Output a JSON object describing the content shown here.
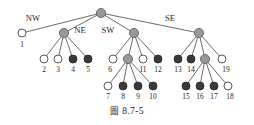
{
  "figure": {
    "caption_prefix": "圖",
    "caption_number": "8.7-5",
    "caption_full": "圖 8.7-5"
  },
  "colors": {
    "white_node": "#ffffff",
    "gray_node": "#989898",
    "dark_node": "#3a3a3a",
    "edge": "#2b2b2b",
    "text": "#1d1d1d",
    "background": "#ffffff"
  },
  "diagram": {
    "type": "quadtree",
    "direction_labels": [
      {
        "id": "nw",
        "text": "NW",
        "x": 33,
        "y": 21
      },
      {
        "id": "ne",
        "text": "NE",
        "x": 80,
        "y": 33
      },
      {
        "id": "sw",
        "text": "SW",
        "x": 108,
        "y": 33
      },
      {
        "id": "se",
        "text": "SE",
        "x": 170,
        "y": 21
      }
    ],
    "nodes": [
      {
        "id": "root",
        "label": "",
        "fill": "gray",
        "cx": 101,
        "cy": 13,
        "r": 4.6
      },
      {
        "id": "n1",
        "label": "1",
        "fill": "white",
        "cx": 22,
        "cy": 33,
        "r": 4.0,
        "label_x": 22,
        "label_y": 47
      },
      {
        "id": "ne",
        "label": "",
        "fill": "gray",
        "cx": 64,
        "cy": 33,
        "r": 4.6
      },
      {
        "id": "sw",
        "label": "",
        "fill": "gray",
        "cx": 134,
        "cy": 33,
        "r": 4.6
      },
      {
        "id": "se",
        "label": "",
        "fill": "gray",
        "cx": 199,
        "cy": 33,
        "r": 4.6
      },
      {
        "id": "n2",
        "label": "2",
        "fill": "white",
        "cx": 44,
        "cy": 59,
        "r": 4.0,
        "label_x": 44,
        "label_y": 72
      },
      {
        "id": "n3",
        "label": "3",
        "fill": "white",
        "cx": 58,
        "cy": 59,
        "r": 4.0,
        "label_x": 58,
        "label_y": 72
      },
      {
        "id": "n4",
        "label": "4",
        "fill": "dark",
        "cx": 73,
        "cy": 59,
        "r": 4.0,
        "label_x": 73,
        "label_y": 72
      },
      {
        "id": "n5",
        "label": "5",
        "fill": "dark",
        "cx": 88,
        "cy": 59,
        "r": 4.0,
        "label_x": 88,
        "label_y": 72
      },
      {
        "id": "n6",
        "label": "6",
        "fill": "white",
        "cx": 113,
        "cy": 59,
        "r": 4.0,
        "label_x": 110,
        "label_y": 72
      },
      {
        "id": "swq",
        "label": "",
        "fill": "gray",
        "cx": 128,
        "cy": 59,
        "r": 4.6
      },
      {
        "id": "n11",
        "label": "11",
        "fill": "white",
        "cx": 143,
        "cy": 59,
        "r": 4.0,
        "label_x": 143,
        "label_y": 72
      },
      {
        "id": "n12",
        "label": "12",
        "fill": "dark",
        "cx": 158,
        "cy": 59,
        "r": 4.0,
        "label_x": 158,
        "label_y": 72
      },
      {
        "id": "n13",
        "label": "13",
        "fill": "dark",
        "cx": 178,
        "cy": 59,
        "r": 4.0,
        "label_x": 178,
        "label_y": 72
      },
      {
        "id": "n14",
        "label": "14",
        "fill": "dark",
        "cx": 191,
        "cy": 59,
        "r": 4.0,
        "label_x": 191,
        "label_y": 72
      },
      {
        "id": "seq",
        "label": "",
        "fill": "gray",
        "cx": 205,
        "cy": 59,
        "r": 4.6
      },
      {
        "id": "n19",
        "label": "19",
        "fill": "white",
        "cx": 222,
        "cy": 59,
        "r": 4.0,
        "label_x": 226,
        "label_y": 72
      },
      {
        "id": "n7",
        "label": "7",
        "fill": "white",
        "cx": 108,
        "cy": 86,
        "r": 4.0,
        "label_x": 108,
        "label_y": 99
      },
      {
        "id": "n8",
        "label": "8",
        "fill": "dark",
        "cx": 123,
        "cy": 86,
        "r": 4.0,
        "label_x": 123,
        "label_y": 99
      },
      {
        "id": "n9",
        "label": "9",
        "fill": "dark",
        "cx": 138,
        "cy": 86,
        "r": 4.0,
        "label_x": 138,
        "label_y": 99
      },
      {
        "id": "n10",
        "label": "10",
        "fill": "dark",
        "cx": 153,
        "cy": 86,
        "r": 4.0,
        "label_x": 153,
        "label_y": 99
      },
      {
        "id": "n15",
        "label": "15",
        "fill": "dark",
        "cx": 186,
        "cy": 86,
        "r": 4.0,
        "label_x": 186,
        "label_y": 99
      },
      {
        "id": "n16",
        "label": "16",
        "fill": "dark",
        "cx": 200,
        "cy": 86,
        "r": 4.0,
        "label_x": 200,
        "label_y": 99
      },
      {
        "id": "n17",
        "label": "17",
        "fill": "dark",
        "cx": 214,
        "cy": 86,
        "r": 4.0,
        "label_x": 214,
        "label_y": 99
      },
      {
        "id": "n18",
        "label": "18",
        "fill": "white",
        "cx": 228,
        "cy": 86,
        "r": 4.0,
        "label_x": 230,
        "label_y": 99
      }
    ],
    "edges": [
      {
        "from": "root",
        "to": "n1"
      },
      {
        "from": "root",
        "to": "ne"
      },
      {
        "from": "root",
        "to": "sw"
      },
      {
        "from": "root",
        "to": "se"
      },
      {
        "from": "ne",
        "to": "n2"
      },
      {
        "from": "ne",
        "to": "n3"
      },
      {
        "from": "ne",
        "to": "n4"
      },
      {
        "from": "ne",
        "to": "n5"
      },
      {
        "from": "sw",
        "to": "n6"
      },
      {
        "from": "sw",
        "to": "swq"
      },
      {
        "from": "sw",
        "to": "n11"
      },
      {
        "from": "sw",
        "to": "n12"
      },
      {
        "from": "se",
        "to": "n13"
      },
      {
        "from": "se",
        "to": "n14"
      },
      {
        "from": "se",
        "to": "seq"
      },
      {
        "from": "se",
        "to": "n19"
      },
      {
        "from": "swq",
        "to": "n7"
      },
      {
        "from": "swq",
        "to": "n8"
      },
      {
        "from": "swq",
        "to": "n9"
      },
      {
        "from": "swq",
        "to": "n10"
      },
      {
        "from": "seq",
        "to": "n15"
      },
      {
        "from": "seq",
        "to": "n16"
      },
      {
        "from": "seq",
        "to": "n17"
      },
      {
        "from": "seq",
        "to": "n18"
      }
    ]
  }
}
